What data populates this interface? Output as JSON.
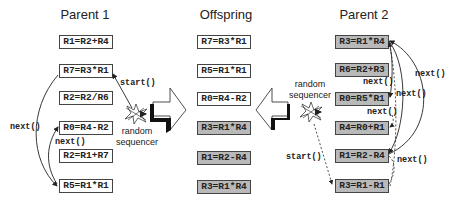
{
  "parent1": {
    "title": "Parent 1",
    "instructions": [
      {
        "text": "R1=R2+R4",
        "shaded": false
      },
      {
        "text": "R7=R3*R1",
        "shaded": false
      },
      {
        "text": "R2=R2/R6",
        "shaded": false
      },
      {
        "text": "R0=R4-R2",
        "shaded": false
      },
      {
        "text": "R2=R1+R7",
        "shaded": false
      },
      {
        "text": "R5=R1*R1",
        "shaded": false
      }
    ],
    "labels": {
      "start": "start()",
      "next1": "next()",
      "next2": "next()"
    },
    "sequencer": {
      "line1": "random",
      "line2": "sequencer"
    }
  },
  "offspring": {
    "title": "Offspring",
    "instructions": [
      {
        "text": "R7=R3*R1",
        "shaded": false
      },
      {
        "text": "R5=R1*R1",
        "shaded": false
      },
      {
        "text": "R0=R4-R2",
        "shaded": false
      },
      {
        "text": "R3=R1*R4",
        "shaded": true
      },
      {
        "text": "R1=R2-R4",
        "shaded": true
      },
      {
        "text": "R3=R1*R4",
        "shaded": true
      }
    ]
  },
  "parent2": {
    "title": "Parent 2",
    "instructions": [
      {
        "text": "R3=R1*R4",
        "shaded": true
      },
      {
        "text": "R6=R2+R3",
        "shaded": true
      },
      {
        "text": "R0=R5*R1",
        "shaded": true
      },
      {
        "text": "R4=R0+R1",
        "shaded": true
      },
      {
        "text": "R1=R2-R4",
        "shaded": true
      },
      {
        "text": "R3=R1-R1",
        "shaded": true
      }
    ],
    "labels": {
      "start": "start()",
      "next_a": "next()",
      "next_b": "next()",
      "next_c": "next()",
      "next_d": "next()",
      "next_e": "next()"
    },
    "sequencer": {
      "line1": "random",
      "line2": "sequencer"
    }
  },
  "colors": {
    "shaded_fill": "#b9b9b9",
    "border": "#444444",
    "text": "#222222"
  }
}
